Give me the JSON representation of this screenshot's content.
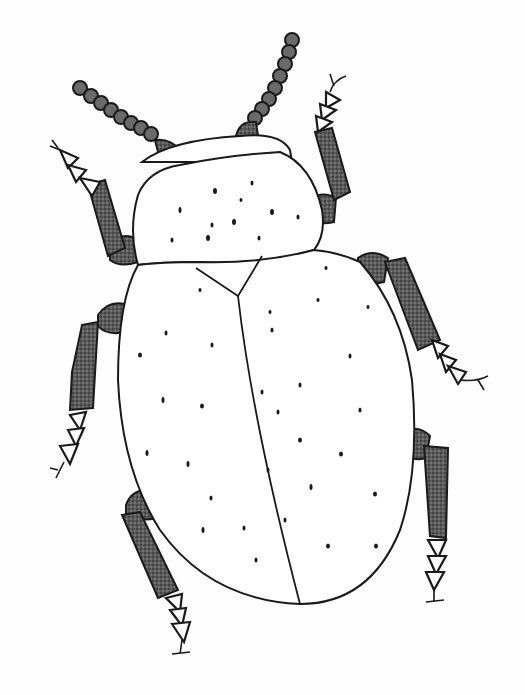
{
  "image": {
    "subject": "beetle line drawing",
    "style": "pencil sketch with stippled shading",
    "width": 525,
    "height": 695,
    "colors": {
      "background": "#fefefe",
      "ink": "#1a1a1a",
      "shading": "#555555"
    },
    "parts": {
      "antennae": 2,
      "legs": 6,
      "body_sections": [
        "pronotum",
        "elytra-left",
        "elytra-right"
      ]
    }
  }
}
